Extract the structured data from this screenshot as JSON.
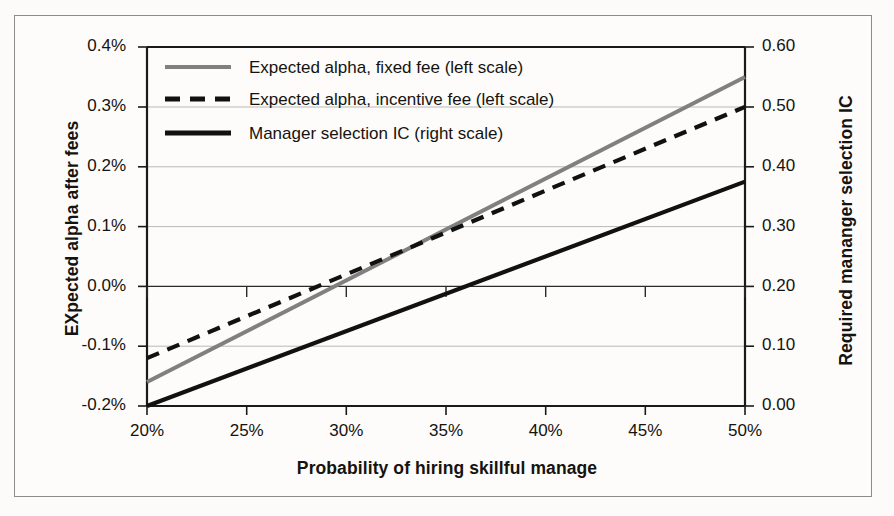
{
  "chart_data": {
    "type": "line",
    "title": "",
    "xlabel": "Probability of hiring skillful manage",
    "ylabel": "EXpected alpha after fees",
    "ylabel_right": "Required mananger selection IC",
    "xlim": [
      20,
      50
    ],
    "ylim": [
      -0.2,
      0.4
    ],
    "ylim_right": [
      0.0,
      0.6
    ],
    "xticks": [
      "20%",
      "25%",
      "30%",
      "35%",
      "40%",
      "45%",
      "50%"
    ],
    "xtick_values": [
      20,
      25,
      30,
      35,
      40,
      45,
      50
    ],
    "yticks": [
      "-0.2%",
      "-0.1%",
      "0.0%",
      "0.1%",
      "0.2%",
      "0.3%",
      "0.4%"
    ],
    "ytick_values": [
      -0.2,
      -0.1,
      0.0,
      0.1,
      0.2,
      0.3,
      0.4
    ],
    "yticks_right": [
      "0.00",
      "0.10",
      "0.20",
      "0.30",
      "0.40",
      "0.50",
      "0.60"
    ],
    "ytick_values_right": [
      0.0,
      0.1,
      0.2,
      0.3,
      0.4,
      0.5,
      0.6
    ],
    "grid": true,
    "legend_position": "upper left",
    "x": [
      20,
      50
    ],
    "series": [
      {
        "name": "Expected alpha, fixed fee (left scale)",
        "axis": "left",
        "style": "solid",
        "color": "#808080",
        "values": [
          -0.16,
          0.35
        ]
      },
      {
        "name": "Expected alpha, incentive fee (left scale)",
        "axis": "left",
        "style": "dashed",
        "color": "#111111",
        "values": [
          -0.12,
          0.3
        ]
      },
      {
        "name": "Manager selection IC (right scale)",
        "axis": "right",
        "style": "solid",
        "color": "#111111",
        "values": [
          0.0,
          0.375
        ]
      }
    ]
  },
  "legend": {
    "items": [
      {
        "label": "Expected alpha, fixed fee (left scale)"
      },
      {
        "label": "Expected alpha, incentive fee (left scale)"
      },
      {
        "label": "Manager selection IC (right scale)"
      }
    ]
  },
  "colors": {
    "fixed_fee_line": "#808080",
    "incentive_fee_line": "#111111",
    "ic_line": "#111111",
    "frame": "#8c8c88",
    "grid": "#b9b9b4",
    "axis": "#1a1a18"
  }
}
